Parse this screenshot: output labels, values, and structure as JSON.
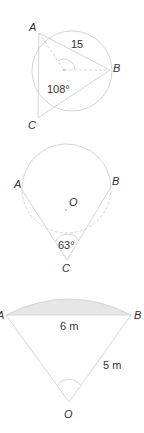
{
  "diagrams": [
    {
      "id": "triangle-in-circle",
      "points": {
        "A": "A",
        "B": "B",
        "C": "C"
      },
      "side_label": "15",
      "angle_label": "108°"
    },
    {
      "id": "inscribed-angle",
      "points": {
        "A": "A",
        "B": "B",
        "C": "C",
        "O": "O"
      },
      "angle_label": "63°"
    },
    {
      "id": "circular-segment",
      "points": {
        "A": "A",
        "B": "B",
        "O": "O"
      },
      "chord_label": "6 m",
      "radius_label": "5 m",
      "shade_color": "#e6e6e6"
    }
  ],
  "colors": {
    "line": "#d6d6d6",
    "text": "#333333",
    "shade": "#e6e6e6"
  }
}
